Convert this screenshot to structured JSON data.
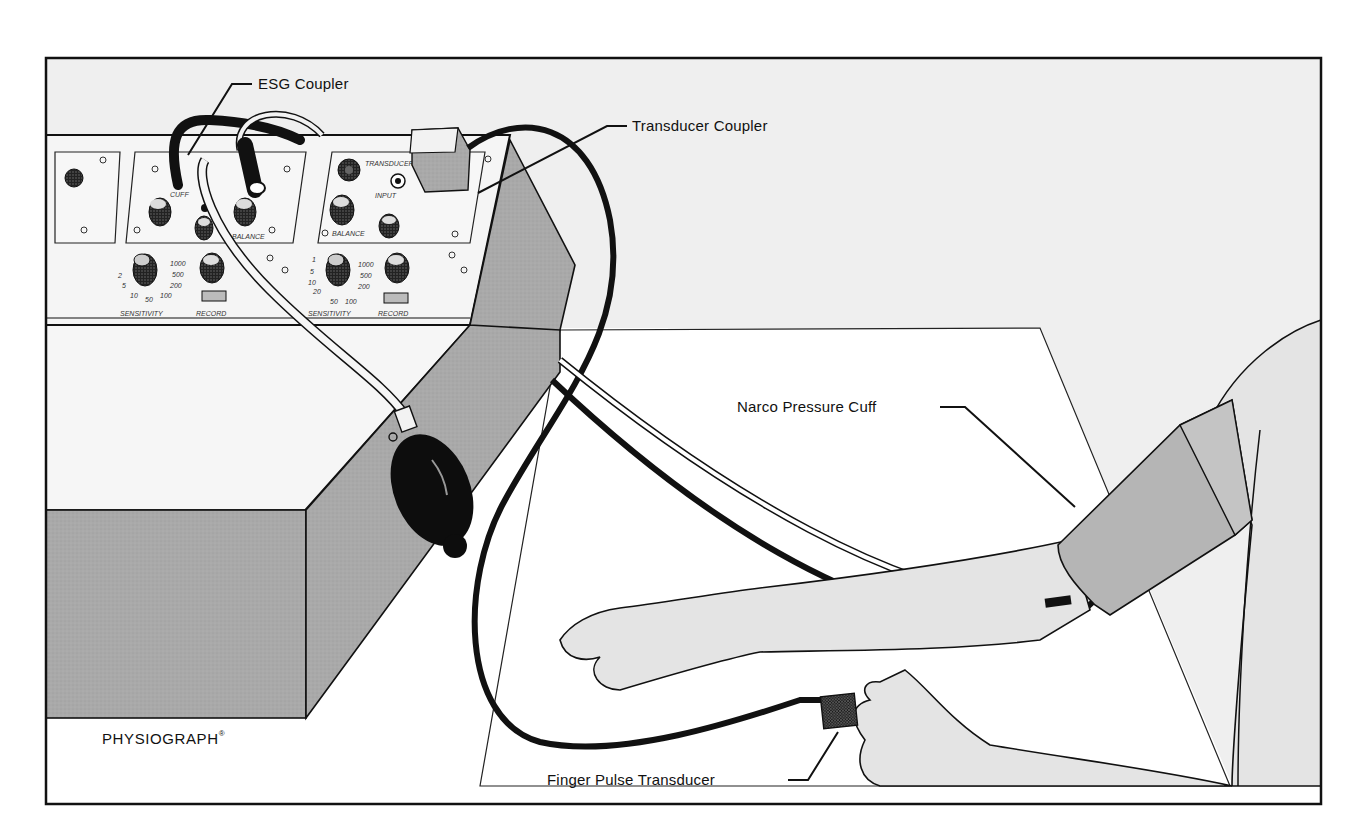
{
  "figure": {
    "frame_color": "#111111",
    "background_color": "#efefef",
    "panel_fill": "#f4f4f4",
    "shadow_fill": "#a9a9a9",
    "skin_fill": "#e6e6e6",
    "cuff_fill": "#b5b5b5"
  },
  "labels": {
    "esg_coupler": "ESG Coupler",
    "transducer_coupler": "Transducer Coupler",
    "narco_pressure_cuff": "Narco Pressure Cuff",
    "finger_pulse_transducer": "Finger Pulse Transducer",
    "brand": "PHYSIOGRAPH",
    "brand_mark": "®"
  },
  "panel_markings": {
    "esg_module": {
      "port_label": "CUFF",
      "knob_label": "BALANCE",
      "sensitivity_label": "SENSITIVITY",
      "record_label": "RECORD",
      "sensitivity_scale": [
        "1",
        "2",
        "5",
        "10",
        "20",
        "50",
        "100",
        "200",
        "500",
        "1000"
      ]
    },
    "transducer_module": {
      "port_label": "TRANSDUCER",
      "input_label": "INPUT",
      "knob_label": "BALANCE",
      "sensitivity_label": "SENSITIVITY",
      "record_label": "RECORD",
      "sensitivity_scale": [
        "1",
        "5",
        "10",
        "20",
        "50",
        "100",
        "200",
        "500",
        "1000"
      ]
    }
  }
}
